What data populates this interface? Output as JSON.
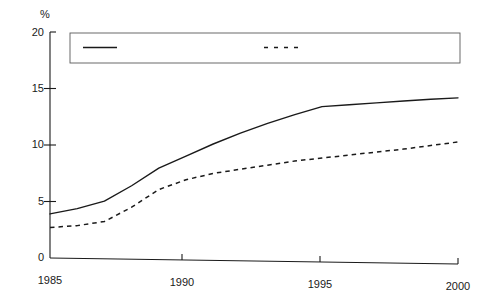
{
  "chart_data": {
    "type": "line",
    "title": "",
    "subtitle": "",
    "xlabel": "",
    "ylabel": "%",
    "unit_label": "%",
    "xlim": [
      1985,
      2000
    ],
    "ylim": [
      0,
      20
    ],
    "grid": false,
    "legend_position": "top-inside",
    "x": [
      1985,
      1986,
      1987,
      1988,
      1989,
      1990,
      1991,
      1992,
      1993,
      1994,
      1995,
      1996,
      1997,
      1998,
      1999,
      2000
    ],
    "xticks": [
      1985,
      1990,
      1995,
      2000
    ],
    "xtick_labels": [
      "1985",
      "1990",
      "1995",
      "2000"
    ],
    "yticks": [
      0,
      5,
      10,
      15,
      20
    ],
    "ytick_labels": [
      "0",
      "5",
      "10",
      "15",
      "20"
    ],
    "series": [
      {
        "name": "Audio-visual equipment",
        "style": "solid",
        "color": "#1a1a1a",
        "values": [
          3.9,
          4.4,
          5.1,
          6.5,
          8.1,
          9.2,
          10.3,
          11.3,
          12.2,
          13.0,
          13.75,
          13.95,
          14.15,
          14.35,
          14.55,
          14.7
        ]
      },
      {
        "name": "Home electrical appliances",
        "style": "dashed",
        "color": "#1a1a1a",
        "values": [
          2.7,
          2.9,
          3.3,
          4.6,
          6.2,
          7.1,
          7.7,
          8.1,
          8.5,
          8.9,
          9.2,
          9.5,
          9.8,
          10.1,
          10.45,
          10.8
        ]
      }
    ]
  },
  "legend": {
    "entries": [
      {
        "label": "Audio-visual equipment",
        "style": "solid"
      },
      {
        "label": "Home electrical appliances",
        "style": "dashed"
      }
    ]
  }
}
